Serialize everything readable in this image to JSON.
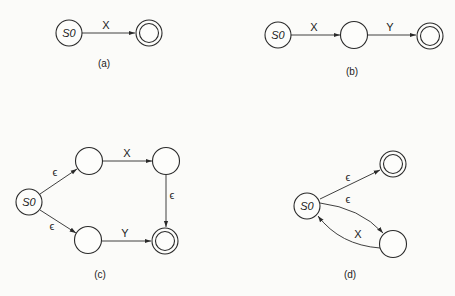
{
  "diagrams": [
    {
      "caption": "(a)",
      "start_label": "S0",
      "edges": [
        {
          "from": "S0",
          "to": "final",
          "label": "X"
        }
      ]
    },
    {
      "caption": "(b)",
      "start_label": "S0",
      "edges": [
        {
          "from": "S0",
          "to": "n1",
          "label": "X"
        },
        {
          "from": "n1",
          "to": "final",
          "label": "Y"
        }
      ]
    },
    {
      "caption": "(c)",
      "start_label": "S0",
      "edges": [
        {
          "from": "S0",
          "to": "top1",
          "label": "ϵ"
        },
        {
          "from": "top1",
          "to": "top2",
          "label": "X"
        },
        {
          "from": "top2",
          "to": "final",
          "label": "ϵ"
        },
        {
          "from": "S0",
          "to": "bot1",
          "label": "ϵ"
        },
        {
          "from": "bot1",
          "to": "final",
          "label": "Y"
        }
      ]
    },
    {
      "caption": "(d)",
      "start_label": "S0",
      "edges": [
        {
          "from": "S0",
          "to": "final",
          "label": "ϵ"
        },
        {
          "from": "S0",
          "to": "n1",
          "label": "ϵ"
        },
        {
          "from": "n1",
          "to": "S0",
          "label": "X"
        }
      ]
    }
  ]
}
